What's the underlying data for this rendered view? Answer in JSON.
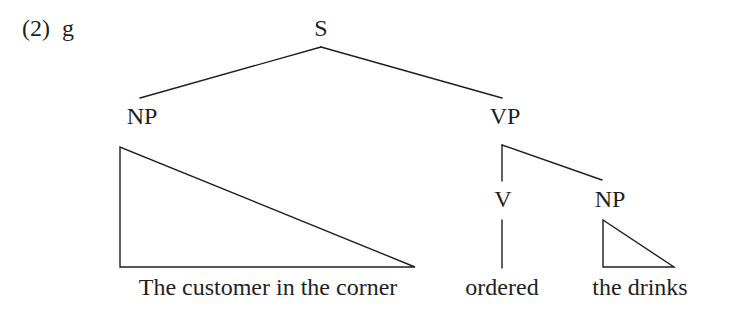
{
  "example": {
    "number": "(2)",
    "sub_label": "g"
  },
  "tree": {
    "root": "S",
    "subject_np": "NP",
    "vp": "VP",
    "verb": "V",
    "object_np": "NP"
  },
  "leaves": {
    "subject": "The customer in the corner",
    "verb": "ordered",
    "object": "the drinks"
  },
  "colors": {
    "ink": "#1f1f1f",
    "background": "#ffffff"
  }
}
